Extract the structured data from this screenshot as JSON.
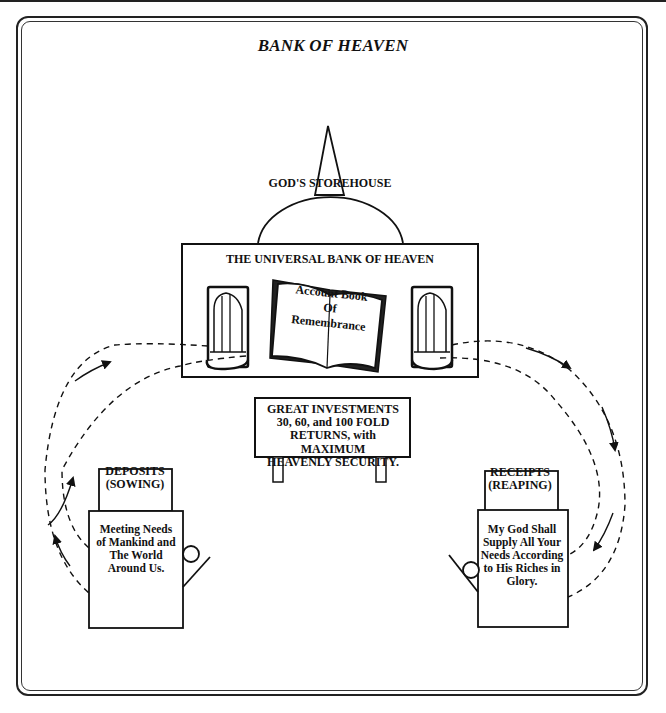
{
  "title": "BANK OF HEAVEN",
  "storehouse": {
    "dome_label": "GOD'S STOREHOUSE",
    "bank_title": "THE UNIVERSAL BANK OF HEAVEN",
    "book_text": "Account Book Of Remembrance",
    "book_lines": [
      "Account Book",
      "Of",
      "Remembrance"
    ],
    "windows": [
      "left-window",
      "right-window"
    ]
  },
  "sign": {
    "lines": [
      "GREAT INVESTMENTS",
      "30, 60, and 100 FOLD",
      "RETURNS, with MAXIMUM",
      "HEAVENLY SECURITY."
    ]
  },
  "deposits": {
    "header_lines": [
      "DEPOSITS",
      "(SOWING)"
    ],
    "body_lines": [
      "Meeting Needs",
      "of Mankind and",
      "The World",
      "Around Us."
    ]
  },
  "receipts": {
    "header_lines": [
      "RECEIPTS",
      "(REAPING)"
    ],
    "body_lines": [
      "My God Shall",
      "Supply All Your",
      "Needs According",
      "to His Riches in",
      "Glory."
    ]
  },
  "flows": [
    {
      "from": "deposits",
      "to": "storehouse",
      "direction": "up",
      "style": "dashed-with-arrows"
    },
    {
      "from": "storehouse",
      "to": "receipts",
      "direction": "down",
      "style": "dashed-with-arrows"
    }
  ]
}
